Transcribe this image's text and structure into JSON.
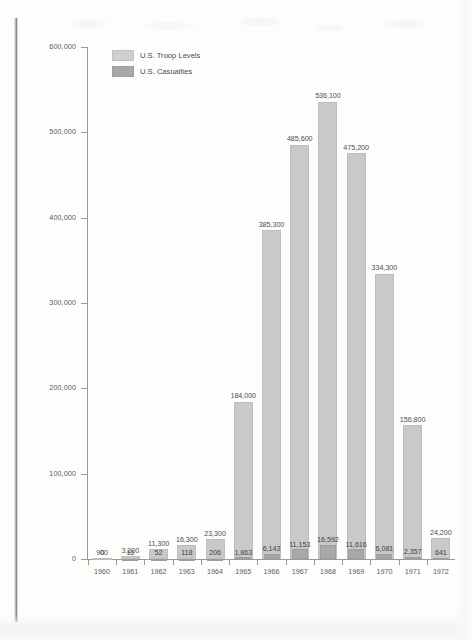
{
  "chart_data": {
    "type": "bar",
    "title": "",
    "subtitle": "",
    "xlabel": "",
    "ylabel": "",
    "ylim": [
      0,
      600000
    ],
    "grid": false,
    "legend_position": "top-left",
    "y_ticks": [
      "0",
      "100,000",
      "200,000",
      "300,000",
      "400,000",
      "500,000",
      "600,000"
    ],
    "y_tick_values": [
      0,
      100000,
      200000,
      300000,
      400000,
      500000,
      600000
    ],
    "categories": [
      "1960",
      "1961",
      "1962",
      "1963",
      "1964",
      "1965",
      "1966",
      "1967",
      "1968",
      "1969",
      "1970",
      "1971",
      "1972"
    ],
    "series": [
      {
        "name": "U.S. Troop Levels",
        "color": "#c9c9c9",
        "values": [
          900,
          3200,
          11300,
          16300,
          23300,
          184000,
          385300,
          485600,
          536100,
          475200,
          334300,
          156800,
          24200
        ],
        "labels": [
          "900",
          "3,200",
          "11,300",
          "16,300",
          "23,300",
          "184,000",
          "385,300",
          "485,600",
          "536,100",
          "475,200",
          "334,300",
          "156,800",
          "24,200"
        ]
      },
      {
        "name": "U.S. Casualties",
        "color": "#a8a8a8",
        "values": [
          0,
          16,
          52,
          118,
          206,
          1863,
          6143,
          11153,
          16592,
          11616,
          6081,
          2357,
          641
        ],
        "labels": [
          "0",
          "16",
          "52",
          "118",
          "206",
          "1,863",
          "6,143",
          "11,153",
          "16,592",
          "11,616",
          "6,081",
          "2,357",
          "641"
        ]
      }
    ]
  },
  "legend": {
    "items": [
      {
        "label": "U.S. Troop Levels",
        "swatch": "troop"
      },
      {
        "label": "U.S. Casualties",
        "swatch": "cas"
      }
    ]
  }
}
